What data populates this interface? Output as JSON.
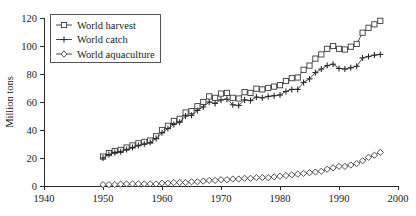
{
  "chart_data": {
    "type": "line",
    "title": "",
    "xlabel": "",
    "ylabel": "Million tons",
    "xlim": [
      1940,
      2000
    ],
    "ylim": [
      0,
      120
    ],
    "xticks": [
      1940,
      1950,
      1960,
      1970,
      1980,
      1990,
      2000
    ],
    "yticks": [
      0,
      20,
      40,
      60,
      80,
      100,
      120
    ],
    "grid": false,
    "legend_position": "top-left",
    "legend_entries": [
      "World harvest",
      "World catch",
      "World aquaculture"
    ],
    "x": [
      1950,
      1951,
      1952,
      1953,
      1954,
      1955,
      1956,
      1957,
      1958,
      1959,
      1960,
      1961,
      1962,
      1963,
      1964,
      1965,
      1966,
      1967,
      1968,
      1969,
      1970,
      1971,
      1972,
      1973,
      1974,
      1975,
      1976,
      1977,
      1978,
      1979,
      1980,
      1981,
      1982,
      1983,
      1984,
      1985,
      1986,
      1987,
      1988,
      1989,
      1990,
      1991,
      1992,
      1993,
      1994,
      1995,
      1996,
      1997
    ],
    "series": [
      {
        "name": "World harvest",
        "marker": "open-square",
        "values": [
          21.0,
          23.5,
          25.0,
          25.8,
          27.5,
          29.0,
          30.5,
          31.5,
          32.5,
          35.5,
          40.0,
          43.0,
          46.5,
          48.0,
          52.5,
          53.5,
          57.0,
          60.0,
          64.0,
          63.0,
          66.0,
          66.5,
          63.0,
          62.5,
          67.0,
          66.5,
          69.5,
          69.0,
          70.0,
          71.0,
          72.0,
          75.0,
          77.0,
          77.5,
          83.0,
          86.0,
          91.0,
          94.0,
          98.0,
          100.0,
          98.0,
          97.5,
          99.5,
          101.5,
          109.5,
          113.0,
          115.5,
          118.0
        ]
      },
      {
        "name": "World catch",
        "marker": "plus",
        "values": [
          20.0,
          22.5,
          24.0,
          24.5,
          26.0,
          27.5,
          29.0,
          30.0,
          31.0,
          34.0,
          38.0,
          41.0,
          44.0,
          45.5,
          50.0,
          50.5,
          54.0,
          56.5,
          60.0,
          59.0,
          61.5,
          62.0,
          58.0,
          57.5,
          61.5,
          61.0,
          63.5,
          63.0,
          64.0,
          64.5,
          65.0,
          67.5,
          69.0,
          69.0,
          74.0,
          76.5,
          81.0,
          83.5,
          86.0,
          87.0,
          84.0,
          83.5,
          84.5,
          85.5,
          91.5,
          92.5,
          93.5,
          94.0
        ]
      },
      {
        "name": "World aquaculture",
        "marker": "open-diamond",
        "values": [
          1.0,
          1.0,
          1.0,
          1.3,
          1.5,
          1.5,
          1.5,
          1.5,
          1.5,
          1.5,
          2.0,
          2.0,
          2.5,
          2.5,
          2.5,
          3.0,
          3.0,
          3.5,
          4.0,
          4.0,
          4.5,
          4.5,
          5.0,
          5.0,
          5.5,
          5.5,
          6.0,
          6.0,
          6.0,
          6.5,
          7.0,
          7.5,
          8.0,
          8.5,
          9.0,
          9.5,
          10.0,
          10.5,
          12.0,
          13.0,
          14.0,
          14.0,
          15.0,
          16.0,
          18.0,
          20.5,
          22.0,
          24.0
        ]
      }
    ]
  },
  "colors": {
    "axis": "#2b2b2b",
    "series_line": "#3a3a3a",
    "marker_fill": "#ffffff",
    "legend_border": "#555555",
    "background": "#ffffff"
  }
}
